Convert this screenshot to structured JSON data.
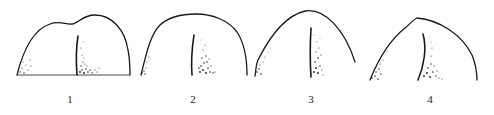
{
  "figure": {
    "colors": {
      "line": "#1a1a1a",
      "background": "#ffffff"
    },
    "panels": [
      {
        "id": 1,
        "label": "1",
        "shape": "double-humped dome with flat base line"
      },
      {
        "id": 2,
        "label": "2",
        "shape": "rounded dome"
      },
      {
        "id": 3,
        "label": "3",
        "shape": "asymmetric pointed dome"
      },
      {
        "id": 4,
        "label": "4",
        "shape": "peaked dome"
      }
    ]
  }
}
